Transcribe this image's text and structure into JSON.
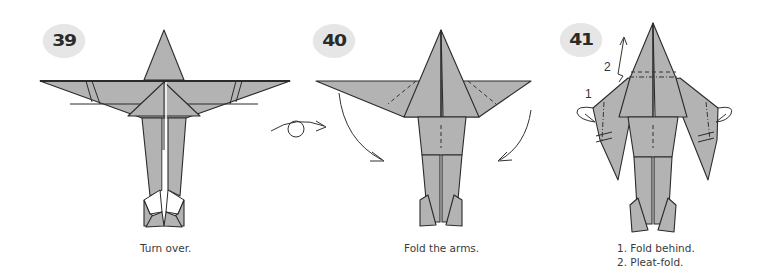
{
  "steps": [
    {
      "number": "39",
      "caption": "Turn over.",
      "symbol": "turn-over-icon"
    },
    {
      "number": "40",
      "caption": "Fold the arms.",
      "symbol": "fold-arrows"
    },
    {
      "number": "41",
      "caption_lines": [
        "1. Fold behind.",
        "2. Pleat-fold."
      ],
      "labels": [
        "1",
        "2"
      ],
      "symbol": "pleat-fold-arrows"
    }
  ],
  "colors": {
    "paper": "#b3b3b3",
    "outline": "#2b2b2b",
    "badge_bg": "#e6e6e6",
    "badge_text": "#2a2a2a",
    "caption_text": "#3a3a3a"
  }
}
